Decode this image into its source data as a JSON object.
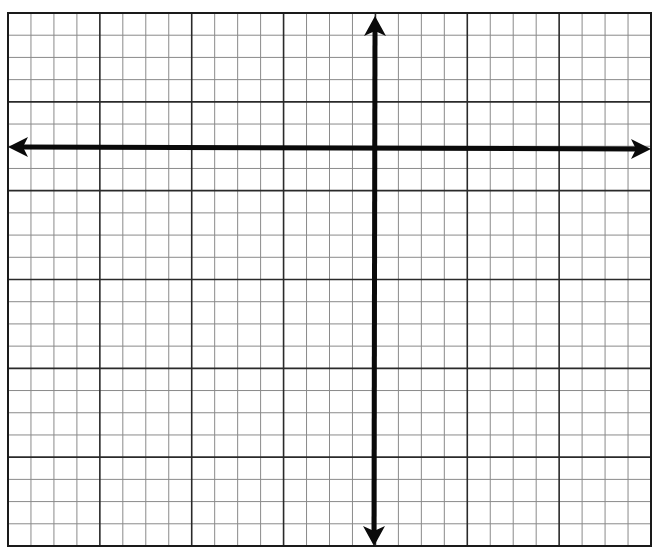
{
  "grid": {
    "left": 8,
    "top": 13,
    "right": 651,
    "bottom": 546,
    "columns": 28,
    "rows": 24,
    "major_every": 4,
    "minor_color": "#8a8a8a",
    "major_color": "#2a2a2a",
    "border_color": "#1a1a1a"
  },
  "axes": {
    "color": "#0a0a0a",
    "width": 5,
    "x_axis": {
      "y": 147,
      "x_start": 8,
      "x_end": 651,
      "arrows": [
        "left",
        "right"
      ]
    },
    "y_axis": {
      "x": 375,
      "y_start": 16,
      "y_end": 546,
      "arrows": [
        "up",
        "down"
      ]
    }
  },
  "labels": []
}
